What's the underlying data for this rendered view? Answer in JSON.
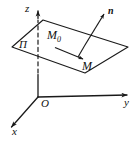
{
  "figure": {
    "kind": "3d-plane-diagram",
    "width": 140,
    "height": 142,
    "background_color": "#ffffff",
    "stroke_color": "#1a1a1a",
    "labels": {
      "z_axis": "z",
      "y_axis": "y",
      "x_axis": "x",
      "origin": "O",
      "plane": "П",
      "normal_vector": "n",
      "point_start": "M",
      "point_start_subscript": "0",
      "point_end": "M"
    },
    "geometry": {
      "origin": [
        38,
        97
      ],
      "z_axis_tip": [
        38,
        8
      ],
      "y_axis_tip": [
        131,
        95
      ],
      "x_axis_tip": [
        8,
        131
      ],
      "plane_corners": [
        [
          12,
          47
        ],
        [
          43,
          20
        ],
        [
          128,
          47
        ],
        [
          85,
          73
        ]
      ],
      "normal_tail": [
        78,
        57
      ],
      "normal_tip": [
        106,
        11
      ],
      "displacement_tail": [
        55,
        48
      ],
      "displacement_tip": [
        86,
        61
      ],
      "z_dashed_from": [
        38,
        20
      ],
      "z_dashed_to": [
        38,
        73
      ]
    }
  }
}
